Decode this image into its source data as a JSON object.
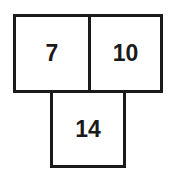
{
  "diagram": {
    "boxes": [
      {
        "id": "top-left",
        "value": "7"
      },
      {
        "id": "top-right",
        "value": "10"
      },
      {
        "id": "bottom",
        "value": "14"
      }
    ]
  }
}
